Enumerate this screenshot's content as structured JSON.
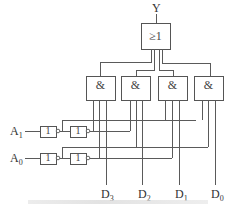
{
  "diagram": {
    "type": "4-to-1 multiplexer (data selector) logic circuit",
    "output": {
      "label": "Y"
    },
    "or_gate": {
      "symbol": "≥1",
      "inputs": 4
    },
    "and_gates": [
      {
        "id": "G3",
        "symbol": "&",
        "data_input": "D3"
      },
      {
        "id": "G2",
        "symbol": "&",
        "data_input": "D2"
      },
      {
        "id": "G1",
        "symbol": "&",
        "data_input": "D1"
      },
      {
        "id": "G0",
        "symbol": "&",
        "data_input": "D0"
      }
    ],
    "select_inputs": [
      {
        "name": "A",
        "sub": "1",
        "not_gates": [
          {
            "symbol": "1"
          },
          {
            "symbol": "1"
          }
        ]
      },
      {
        "name": "A",
        "sub": "0",
        "not_gates": [
          {
            "symbol": "1"
          },
          {
            "symbol": "1"
          }
        ]
      }
    ],
    "data_inputs": [
      {
        "name": "D",
        "sub": "3"
      },
      {
        "name": "D",
        "sub": "2"
      },
      {
        "name": "D",
        "sub": "1"
      },
      {
        "name": "D",
        "sub": "0"
      }
    ],
    "caption": ""
  }
}
